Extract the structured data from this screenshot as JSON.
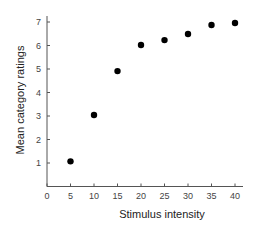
{
  "chart_data": {
    "type": "scatter",
    "title": "",
    "xlabel": "Stimulus intensity",
    "ylabel": "Mean category ratings",
    "xlim": [
      0,
      40
    ],
    "ylim": [
      0,
      7
    ],
    "xticks": [
      0,
      5,
      10,
      15,
      20,
      25,
      30,
      35,
      40
    ],
    "yticks": [
      1,
      2,
      3,
      4,
      5,
      6,
      7
    ],
    "grid": false,
    "legend": null,
    "series": [
      {
        "name": "Mean category ratings",
        "marker": "filled-circle",
        "color": "#000000",
        "x": [
          5,
          10,
          15,
          20,
          25,
          30,
          35,
          40
        ],
        "y": [
          1.07,
          3.04,
          4.91,
          6.02,
          6.23,
          6.49,
          6.87,
          6.96
        ]
      }
    ]
  },
  "colors": {
    "axis": "#555555",
    "marker": "#000000",
    "text": "#333333"
  }
}
